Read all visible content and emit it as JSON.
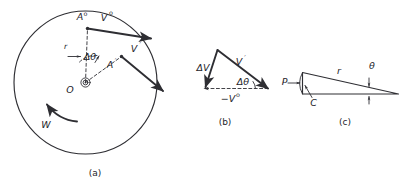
{
  "figure": {
    "background_color": "#ffffff",
    "ink_color": "#2e2e33",
    "panels": [
      {
        "id": "a",
        "caption": "(a)",
        "description": "rotating-wheel-velocity-vectors",
        "labels": {
          "body": "W",
          "center": "O",
          "radius": "r",
          "angle": "Δθ",
          "point_initial_base": "A",
          "point_initial_sup": "o",
          "point_final_base": "A",
          "point_final_sup": "′",
          "velocity_initial_base": "V",
          "velocity_initial_sup": "o",
          "velocity_final_base": "V",
          "velocity_final_sup": "′"
        }
      },
      {
        "id": "b",
        "caption": "(b)",
        "description": "velocity-difference-triangle",
        "labels": {
          "delta_v": "ΔV",
          "velocity_final_base": "V",
          "velocity_final_sup": "′",
          "angle": "Δθ",
          "neg_velocity_initial_base": "−V",
          "neg_velocity_initial_sup": "o"
        }
      },
      {
        "id": "c",
        "caption": "(c)",
        "description": "chord-radius-sliver-geometry",
        "labels": {
          "point_p": "P",
          "point_c": "C",
          "radius": "r",
          "angle": "θ"
        }
      }
    ]
  }
}
